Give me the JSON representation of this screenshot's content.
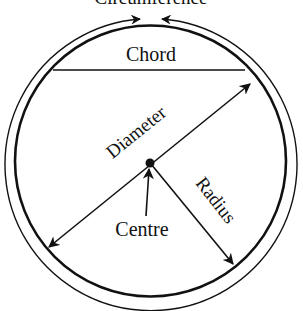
{
  "diagram": {
    "labels": {
      "circumference": "Circumference",
      "chord": "Chord",
      "diameter": "Diameter",
      "radius": "Radius",
      "centre": "Centre"
    },
    "colors": {
      "stroke": "#111111",
      "background": "#ffffff"
    }
  }
}
